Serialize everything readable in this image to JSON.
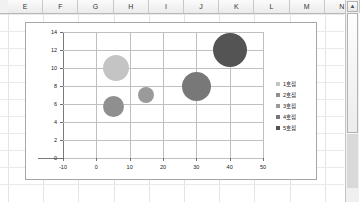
{
  "spreadsheet": {
    "column_headers": [
      "E",
      "F",
      "G",
      "H",
      "I",
      "J",
      "K",
      "L",
      "M",
      "N"
    ],
    "scrollbar": {
      "up_arrow": "▲"
    }
  },
  "chart_data": {
    "type": "scatter",
    "subtype": "bubble",
    "title": "",
    "xlabel": "",
    "ylabel": "",
    "xlim": [
      -10,
      50
    ],
    "ylim": [
      0,
      14
    ],
    "xticks": [
      -10,
      0,
      10,
      20,
      30,
      40,
      50
    ],
    "yticks": [
      0,
      2,
      4,
      6,
      8,
      10,
      12,
      14
    ],
    "grid": true,
    "legend_position": "right",
    "series": [
      {
        "name": "1호점",
        "x": 6,
        "y": 10.0,
        "size": 26,
        "color": "#c4c4c4"
      },
      {
        "name": "2호점",
        "x": 5,
        "y": 5.7,
        "size": 21,
        "color": "#8f8f8f"
      },
      {
        "name": "3호점",
        "x": 15,
        "y": 7.0,
        "size": 16,
        "color": "#9a9a9a"
      },
      {
        "name": "4호점",
        "x": 30,
        "y": 8.0,
        "size": 29,
        "color": "#787878"
      },
      {
        "name": "5호점",
        "x": 40,
        "y": 12.0,
        "size": 34,
        "color": "#545454"
      }
    ],
    "legend": [
      {
        "label": "1호점",
        "color": "#c4c4c4"
      },
      {
        "label": "2호점",
        "color": "#8f8f8f"
      },
      {
        "label": "3호점",
        "color": "#9a9a9a"
      },
      {
        "label": "4호점",
        "color": "#787878"
      },
      {
        "label": "5호점",
        "color": "#545454"
      }
    ]
  }
}
